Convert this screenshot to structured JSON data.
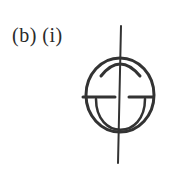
{
  "figure": {
    "label": "(b) (i)",
    "stroke_color": "#333333",
    "background": "#ffffff"
  }
}
